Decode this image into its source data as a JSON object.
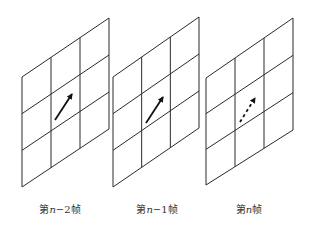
{
  "diagram": {
    "type": "motion-vector-frame-sequence",
    "grid_rows": 3,
    "grid_cols": 3,
    "line_color": "#2a2a2a",
    "arrow_color": "#111111",
    "frames": [
      {
        "label_prefix": "第",
        "label_var": "n",
        "label_suffix": "−2帧",
        "corners": {
          "tl": [
            22,
            77
          ],
          "tr": [
            109,
            18
          ],
          "br": [
            109,
            129
          ],
          "bl": [
            22,
            187
          ]
        },
        "arrow": {
          "from": [
            55,
            120
          ],
          "to": [
            72,
            94
          ],
          "style": "solid"
        },
        "label_x": 60
      },
      {
        "label_prefix": "第",
        "label_var": "n",
        "label_suffix": "−1帧",
        "corners": {
          "tl": [
            113,
            77
          ],
          "tr": [
            199,
            17
          ],
          "br": [
            199,
            128
          ],
          "bl": [
            113,
            187
          ]
        },
        "arrow": {
          "from": [
            146,
            123
          ],
          "to": [
            163,
            97
          ],
          "style": "solid"
        },
        "label_x": 157
      },
      {
        "label_prefix": "第",
        "label_var": "n",
        "label_suffix": "帧",
        "corners": {
          "tl": [
            206,
            78
          ],
          "tr": [
            293,
            18
          ],
          "br": [
            293,
            130
          ],
          "bl": [
            206,
            185
          ]
        },
        "arrow": {
          "from": [
            240,
            122
          ],
          "to": [
            255,
            98
          ],
          "style": "dashed"
        },
        "label_x": 249
      }
    ]
  }
}
